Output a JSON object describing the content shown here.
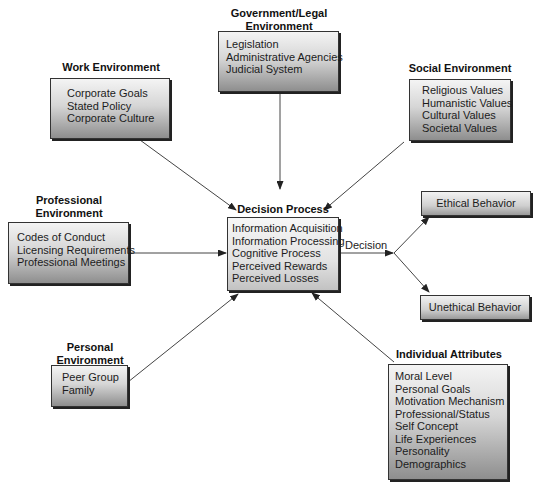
{
  "diagram": {
    "center": {
      "title": "Decision Process",
      "items": [
        "Information Acquisition",
        "Information Processing",
        "Cognitive Process",
        "Perceived Rewards",
        "Perceived Losses"
      ]
    },
    "inputs": {
      "government": {
        "title_line1": "Government/Legal",
        "title_line2": "Environment",
        "items": [
          "Legislation",
          "Administrative Agencies",
          "Judicial System"
        ]
      },
      "work": {
        "title": "Work Environment",
        "items": [
          "Corporate Goals",
          "Stated Policy",
          "Corporate Culture"
        ]
      },
      "social": {
        "title": "Social Environment",
        "items": [
          "Religious Values",
          "Humanistic Values",
          "Cultural Values",
          "Societal Values"
        ]
      },
      "professional": {
        "title_line1": "Professional",
        "title_line2": "Environment",
        "items": [
          "Codes of Conduct",
          "Licensing Requirements",
          "Professional Meetings"
        ]
      },
      "personal": {
        "title_line1": "Personal",
        "title_line2": "Environment",
        "items": [
          "Peer Group",
          "Family"
        ]
      },
      "individual": {
        "title": "Individual Attributes",
        "items": [
          "Moral Level",
          "Personal Goals",
          "Motivation Mechanism",
          "Professional/Status",
          "Self Concept",
          "Life Experiences",
          "Personality",
          "Demographics"
        ]
      }
    },
    "decision_label": "Decision",
    "outcomes": {
      "ethical": "Ethical Behavior",
      "unethical": "Unethical Behavior"
    },
    "colors": {
      "border": "#333333",
      "arrow": "#333333",
      "gradient_top": "#f4f4f4",
      "gradient_bottom": "#8e8e8e"
    }
  }
}
